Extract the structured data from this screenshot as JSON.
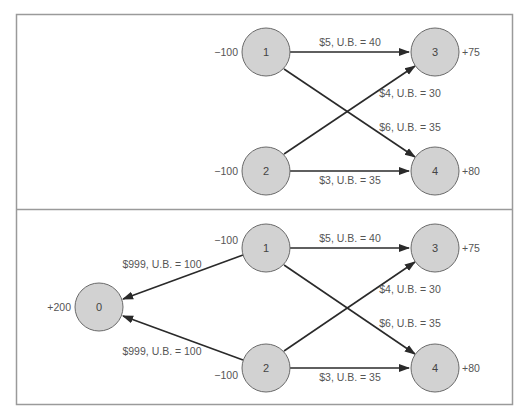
{
  "colors": {
    "frame": "#9a9a9a",
    "node_fill": "#d2d2d2",
    "node_stroke": "#6a6a6a",
    "edge": "#2a2a2a",
    "text": "#555555"
  },
  "panels": [
    {
      "id": "top",
      "nodes": [
        {
          "id": "1",
          "label": "1",
          "supply": "−100"
        },
        {
          "id": "2",
          "label": "2",
          "supply": "−100"
        },
        {
          "id": "3",
          "label": "3",
          "supply": "+75"
        },
        {
          "id": "4",
          "label": "4",
          "supply": "+80"
        }
      ],
      "edges": [
        {
          "from": "1",
          "to": "3",
          "label": "$5, U.B. = 40"
        },
        {
          "from": "2",
          "to": "3",
          "label": "$4, U.B. = 30"
        },
        {
          "from": "1",
          "to": "4",
          "label": "$6, U.B. = 35"
        },
        {
          "from": "2",
          "to": "4",
          "label": "$3, U.B. = 35"
        }
      ]
    },
    {
      "id": "bottom",
      "nodes": [
        {
          "id": "0",
          "label": "0",
          "supply": "+200"
        },
        {
          "id": "1",
          "label": "1",
          "supply": "−100"
        },
        {
          "id": "2",
          "label": "2",
          "supply": "−100"
        },
        {
          "id": "3",
          "label": "3",
          "supply": "+75"
        },
        {
          "id": "4",
          "label": "4",
          "supply": "+80"
        }
      ],
      "edges": [
        {
          "from": "1",
          "to": "0",
          "label": "$999, U.B. = 100"
        },
        {
          "from": "2",
          "to": "0",
          "label": "$999, U.B. = 100"
        },
        {
          "from": "1",
          "to": "3",
          "label": "$5, U.B. = 40"
        },
        {
          "from": "2",
          "to": "3",
          "label": "$4, U.B. = 30"
        },
        {
          "from": "1",
          "to": "4",
          "label": "$6, U.B. = 35"
        },
        {
          "from": "2",
          "to": "4",
          "label": "$3, U.B. = 35"
        }
      ]
    }
  ]
}
